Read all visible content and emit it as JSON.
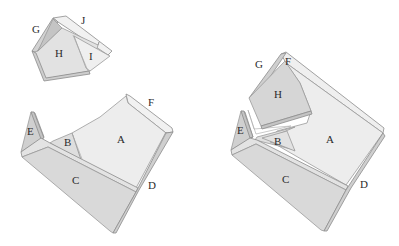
{
  "figure": {
    "width": 399,
    "height": 246,
    "colors": {
      "background": "#ffffff",
      "face_light": "#ececec",
      "face_mid": "#dedede",
      "face_dark": "#cfcfcf",
      "rim_light": "#f4f4f4",
      "rim_dark": "#bdbdbd",
      "stroke": "#9a9a9a",
      "label": "#2b2b2b"
    }
  },
  "left_top_piece": {
    "labels": {
      "G": "G",
      "H": "H",
      "I": "I",
      "J": "J"
    }
  },
  "left_bottom_piece": {
    "labels": {
      "A": "A",
      "B": "B",
      "C": "C",
      "D": "D",
      "E": "E",
      "F": "F"
    }
  },
  "right_assembled": {
    "labels": {
      "A": "A",
      "B": "B",
      "C": "C",
      "D": "D",
      "E": "E",
      "F": "F",
      "G": "G",
      "H": "H"
    }
  }
}
